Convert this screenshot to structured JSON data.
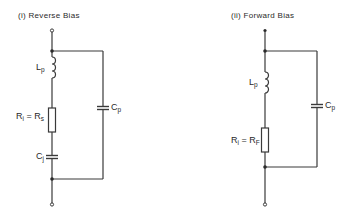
{
  "diagrams": [
    {
      "title": "(i) Reverse Bias",
      "labels": {
        "inductor": {
          "main": "L",
          "sub": "p"
        },
        "resistor": {
          "main": "R",
          "sub": "i",
          "eq": " = R",
          "eq_sub": "s"
        },
        "junction_cap": {
          "main": "C",
          "sub": "j"
        },
        "parallel_cap": {
          "main": "C",
          "sub": "p"
        }
      }
    },
    {
      "title": "(ii) Forward Bias",
      "labels": {
        "inductor": {
          "main": "L",
          "sub": "p"
        },
        "resistor": {
          "main": "R",
          "sub": "i",
          "eq": " = R",
          "eq_sub": "F"
        },
        "parallel_cap": {
          "main": "C",
          "sub": "p"
        }
      }
    }
  ]
}
